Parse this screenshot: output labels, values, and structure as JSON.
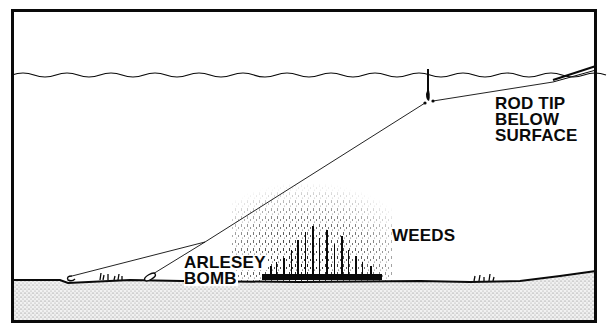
{
  "diagram": {
    "type": "fishing-rig-cross-section",
    "labels": {
      "rod_tip": [
        "ROD TIP",
        "BELOW",
        "SURFACE"
      ],
      "weeds": "WEEDS",
      "bomb": [
        "ARLESEY",
        "BOMB"
      ]
    },
    "elements": {
      "water_surface": "wavy-line",
      "float": "float-icon",
      "rod_tip": "rod-tip-icon",
      "main_line": "fishing-line",
      "hook_link": "hook-link-line",
      "hook": "hook-icon",
      "bomb": "arlesey-bomb-icon",
      "weed_bed": "weeds-stipple",
      "lake_bed": "stippled-ground"
    },
    "colors": {
      "ink": "#0a0a0a",
      "background": "#ffffff",
      "ground_stipple": "#9a9a9a"
    }
  }
}
